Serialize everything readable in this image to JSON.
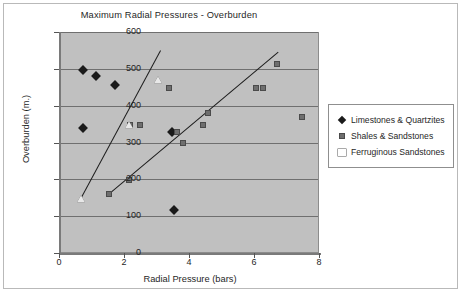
{
  "chart_data": {
    "type": "scatter",
    "title": "Maximum Radial Pressures - Overburden",
    "xlabel": "Radial Pressure (bars)",
    "ylabel": "Overburden (m.)",
    "xlim": [
      0,
      8
    ],
    "ylim": [
      0,
      600
    ],
    "xticks": [
      0,
      2,
      4,
      6,
      8
    ],
    "yticks": [
      0,
      100,
      200,
      300,
      400,
      500,
      600
    ],
    "grid": "horizontal",
    "legend_position": "right",
    "plot_background": "#c0c0c0",
    "series": [
      {
        "name": "Limestones & Quartzites",
        "marker": "diamond",
        "color": "#1a1a1a",
        "points": [
          {
            "x": 0.72,
            "y": 500
          },
          {
            "x": 1.12,
            "y": 484
          },
          {
            "x": 1.68,
            "y": 459
          },
          {
            "x": 0.7,
            "y": 341
          },
          {
            "x": 3.45,
            "y": 331
          },
          {
            "x": 3.5,
            "y": 120
          }
        ]
      },
      {
        "name": "Shales & Sandstones",
        "marker": "square",
        "color": "#6e6e6e",
        "points": [
          {
            "x": 6.68,
            "y": 515
          },
          {
            "x": 3.35,
            "y": 450
          },
          {
            "x": 6.02,
            "y": 450
          },
          {
            "x": 6.24,
            "y": 450
          },
          {
            "x": 4.55,
            "y": 382
          },
          {
            "x": 7.45,
            "y": 372
          },
          {
            "x": 2.15,
            "y": 350
          },
          {
            "x": 2.45,
            "y": 351
          },
          {
            "x": 4.4,
            "y": 351
          },
          {
            "x": 3.6,
            "y": 331
          },
          {
            "x": 3.78,
            "y": 302
          },
          {
            "x": 2.12,
            "y": 200
          },
          {
            "x": 1.5,
            "y": 162
          }
        ]
      },
      {
        "name": "Ferruginous Sandstones",
        "marker": "triangle",
        "color": "#ffffff",
        "points": [
          {
            "x": 3.0,
            "y": 472
          },
          {
            "x": 2.13,
            "y": 349
          },
          {
            "x": 0.65,
            "y": 149
          }
        ]
      }
    ],
    "trendlines": [
      {
        "name": "upper-trend",
        "x1": 0.63,
        "y1": 148,
        "x2": 3.09,
        "y2": 551
      },
      {
        "name": "lower-trend",
        "x1": 1.46,
        "y1": 160,
        "x2": 6.72,
        "y2": 549
      }
    ]
  }
}
